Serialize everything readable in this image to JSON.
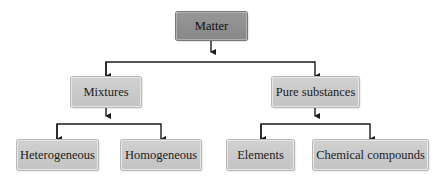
{
  "diagram": {
    "type": "hierarchy-tree",
    "colors": {
      "root_fill": "#8f8f8f",
      "node_fill": "#c8c8c8",
      "line": "#1a1a1a"
    },
    "root": {
      "label": "Matter"
    },
    "level1": [
      {
        "label": "Mixtures"
      },
      {
        "label": "Pure substances"
      }
    ],
    "level2": [
      {
        "label": "Heterogeneous",
        "parent": "Mixtures"
      },
      {
        "label": "Homogeneous",
        "parent": "Mixtures"
      },
      {
        "label": "Elements",
        "parent": "Pure substances"
      },
      {
        "label": "Chemical compounds",
        "parent": "Pure substances"
      }
    ]
  }
}
